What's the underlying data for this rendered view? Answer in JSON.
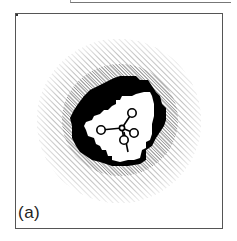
{
  "figure": {
    "panel_label": "(a)",
    "colors": {
      "hatch": "#8a8a8a",
      "dense_zone": "#9a9a9a",
      "contour": "#000000",
      "cavity": "#ffffff",
      "frame": "#555555"
    },
    "molecule": {
      "center_atom": [
        122,
        128
      ],
      "ligand_atoms": [
        [
          101,
          130
        ],
        [
          132,
          113
        ],
        [
          134,
          133
        ],
        [
          124,
          140
        ]
      ],
      "tail_end": [
        128,
        152
      ]
    }
  }
}
